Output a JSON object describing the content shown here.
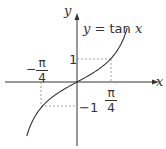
{
  "chart_data": {
    "type": "line",
    "title": "y = tan x",
    "xlabel": "x",
    "ylabel": "y",
    "series": [
      {
        "name": "y = tan x",
        "x": [
          -1.2,
          -1.0,
          -0.785,
          -0.5,
          0,
          0.5,
          0.785,
          1.0,
          1.2
        ],
        "values": [
          -2.57,
          -1.56,
          -1,
          -0.55,
          0,
          0.55,
          1,
          1.56,
          2.57
        ]
      }
    ],
    "annotations": [
      {
        "label": "1",
        "at": [
          0,
          1
        ],
        "type": "y-tick"
      },
      {
        "label": "-1",
        "at": [
          0,
          -1
        ],
        "type": "y-tick"
      },
      {
        "label": "π/4",
        "at": [
          0.785,
          0
        ],
        "type": "x-tick"
      },
      {
        "label": "-π/4",
        "at": [
          -0.785,
          0
        ],
        "type": "x-tick"
      }
    ],
    "guides": "dashed lines from (±π/4, ±1) to axes",
    "grid": false
  },
  "labels": {
    "equation": "y = tan x",
    "x_axis": "x",
    "y_axis": "y",
    "y_pos": "1",
    "y_neg": "−1",
    "pi": "π",
    "four": "4",
    "minus": "−"
  }
}
